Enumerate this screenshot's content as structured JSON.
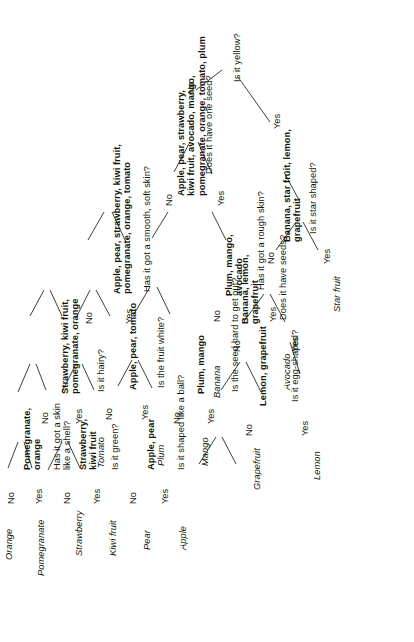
{
  "figure": {
    "kind": "decision-tree",
    "orientation": "rotated-90-counterclockwise"
  },
  "edge_labels": {
    "yes": "Yes",
    "no": "No"
  },
  "leaves": {
    "apple": "Apple",
    "pear": "Pear",
    "kiwi_fruit": "Kiwi fruit",
    "strawberry": "Strawberry",
    "pomegranate": "Pomegranate",
    "orange": "Orange",
    "tomato": "Tomato",
    "mango": "Mango",
    "plum": "Plum",
    "avocado": "Avocado",
    "lemon": "Lemon",
    "grapefruit": "Grapefruit",
    "banana": "Banana",
    "star_fruit": "Star fruit"
  },
  "questions": {
    "shaped_like_ball": "Is it shaped like a ball?",
    "is_green": "Is it green?",
    "skin_like_shell": "Has it got a skin\nlike a shell?",
    "fruit_white": "Is the fruit white?",
    "is_hairy": "Is it hairy?",
    "smooth_soft_skin": "Has it got a smooth, soft skin?",
    "seed_hard_to_get_out": "Is the seed hard to get out?",
    "rough_skin": "Has it got a rough skin?",
    "have_one_seed": "Does it have one seed?",
    "egg_shaped": "Is it egg-shaped?",
    "have_seeds": "Does it have seeds?",
    "star_shaped": "Is it star shaped?",
    "is_yellow": "Is it yellow?"
  },
  "sets": {
    "apple_pear": "Apple, pear",
    "strawberry_kiwi": "Strawberry,\nkiwi fruit",
    "pomegranate_orange": "Pomegranate,\norange",
    "apple_pear_tomato": "Apple, pear, tomato",
    "strawberry_kiwi_pom_orange": "Strawberry, kiwi fruit,\npomegranate, orange",
    "smooth_group": "Apple, pear, strawberry, kiwi fruit,\npomegranate, orange, tomato",
    "plum_mango": "Plum, mango",
    "plum_mango_avocado": "Plum, mango,\navocado",
    "one_seed_group": "Apple, pear, strawberry,\nkiwi fruit, avocado, mango,\npomegranate, orange, tomato, plum",
    "lemon_grapefruit": "Lemon, grapefruit",
    "banana_lemon_grapefruit": "Banana, lemon,\ngrapefruit",
    "yellow_group": "Banana, star fruit, lemon,\ngrapefruit"
  },
  "tree_structure": {
    "root": {
      "question": "Is it yellow?",
      "yes": {
        "set": "Banana, star fruit, lemon, grapefruit",
        "question": "Is it star shaped?",
        "yes": "Star fruit",
        "no": {
          "set": "Banana, lemon, grapefruit",
          "question": "Does it have seeds?",
          "yes": {
            "set": "Lemon, grapefruit",
            "question": "Is it egg-shaped?",
            "yes": "Lemon",
            "no": "Grapefruit"
          },
          "no": "Banana"
        }
      },
      "no": {
        "set": "Apple, pear, strawberry, kiwi fruit, avocado, mango, pomegranate, orange, tomato, plum",
        "question": "Does it have one seed?",
        "yes": {
          "set": "Plum, mango, avocado",
          "question": "Has it got a rough skin?",
          "yes": "Avocado",
          "no": {
            "set": "Plum, mango",
            "question": "Is the seed hard to get out?",
            "yes": "Mango",
            "no": "Plum"
          }
        },
        "no": {
          "set": "Apple, pear, strawberry, kiwi fruit, pomegranate, orange, tomato",
          "question": "Has it got a smooth, soft skin?",
          "yes": {
            "set": "Apple, pear, tomato",
            "question": "Is the fruit white?",
            "yes": {
              "set": "Apple, pear",
              "question": "Is it shaped like a ball?",
              "yes": "Apple",
              "no": "Pear"
            },
            "no": "Tomato"
          },
          "no": {
            "set": "Strawberry, kiwi fruit, pomegranate, orange",
            "question": "Is it hairy?",
            "yes": {
              "set": "Strawberry, kiwi fruit",
              "question": "Is it green?",
              "yes": "Kiwi fruit",
              "no": "Strawberry"
            },
            "no": {
              "set": "Pomegranate, orange",
              "question": "Has it got a skin like a shell?",
              "yes": "Pomegranate",
              "no": "Orange"
            }
          }
        }
      }
    }
  }
}
